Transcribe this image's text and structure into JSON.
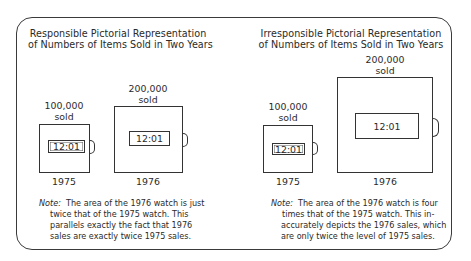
{
  "left_panel": {
    "title": [
      "Responsible Pictorial Representation",
      "of Numbers of Items Sold in Two Years"
    ],
    "watch_1975": {
      "label_top": "100,000",
      "label_bottom": "sold",
      "time": "12:01",
      "year": "1975"
    },
    "watch_1976": {
      "label_top": "200,000",
      "label_bottom": "sold",
      "time": "12:01",
      "year": "1976"
    },
    "note": {
      "lead": "Note:",
      "lines": [
        "The area of the 1976 watch is just",
        "twice that of the 1975 watch.  This",
        "parallels exactly the fact that 1976",
        "sales are exactly twice 1975 sales."
      ]
    }
  },
  "right_panel": {
    "title": [
      "Irresponsible Pictorial Representation",
      "of Numbers of Items Sold in Two Years"
    ],
    "watch_1975": {
      "label_top": "100,000",
      "label_bottom": "sold",
      "time": "12:01",
      "year": "1975"
    },
    "watch_1976": {
      "label_top": "200,000",
      "label_bottom": "sold",
      "time": "12:01",
      "year": "1976"
    },
    "note": {
      "lead": "Note:",
      "lines": [
        "The area of the 1976 watch is four",
        "times that of the 1975 watch.  This in-",
        "accurately depicts the 1976 sales, which",
        "are only twice the level of 1975 sales."
      ]
    }
  },
  "data": {
    "sales_1975": 100000,
    "sales_1976": 200000,
    "responsible_area_ratio": 2,
    "irresponsible_area_ratio": 4
  }
}
